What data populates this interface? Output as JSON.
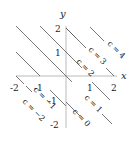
{
  "diagram": {
    "type": "level-curves",
    "axes": {
      "x_label": "x",
      "y_label": "y",
      "x_ticks": [
        "-2",
        "-1",
        "1",
        "2"
      ],
      "y_ticks": [
        "2",
        "1",
        "-1",
        "-2"
      ]
    },
    "lines": [
      {
        "c": -2,
        "label": "c = −2"
      },
      {
        "c": -1,
        "label": "c = −1"
      },
      {
        "c": 0,
        "label": "c = 0"
      },
      {
        "c": 1,
        "label": "c = 1"
      },
      {
        "c": 2,
        "label": "c = 2"
      },
      {
        "c": 3,
        "label": "c = 3"
      },
      {
        "c": 4,
        "label": "c = 4"
      }
    ],
    "colors": {
      "axis": "#aaaaaa",
      "line": "#555555",
      "text": "#222222"
    }
  }
}
